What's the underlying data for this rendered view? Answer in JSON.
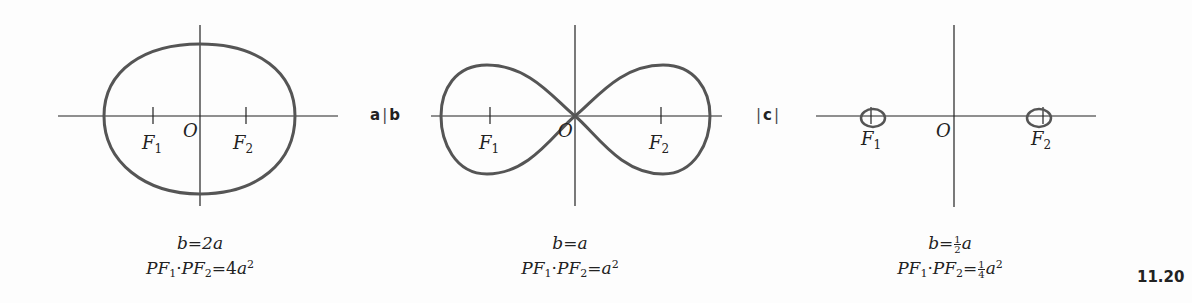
{
  "figure": {
    "number": "11.20",
    "stroke_color": "#555555",
    "axis_color": "#222222"
  },
  "panel_tags": {
    "a": "a",
    "b": "b",
    "c": "c"
  },
  "panels": [
    {
      "id": "a",
      "curve": "oval of Cassini (single oval)",
      "labels": {
        "origin": "O",
        "focus1": "F",
        "focus1_sub": "1",
        "focus2": "F",
        "focus2_sub": "2"
      },
      "caption": {
        "line1_lhs": "b",
        "line1_eq": "=",
        "line1_rhs": "2a",
        "line2_p1": "PF",
        "line2_s1": "1",
        "line2_dot": "·",
        "line2_p2": "PF",
        "line2_s2": "2",
        "line2_eq": "=",
        "line2_coef": "4",
        "line2_var": "a",
        "line2_exp": "2"
      }
    },
    {
      "id": "b",
      "curve": "lemniscate of Bernoulli",
      "labels": {
        "origin": "O",
        "focus1": "F",
        "focus1_sub": "1",
        "focus2": "F",
        "focus2_sub": "2"
      },
      "caption": {
        "line1_lhs": "b",
        "line1_eq": "=",
        "line1_rhs": "a",
        "line2_p1": "PF",
        "line2_s1": "1",
        "line2_dot": "·",
        "line2_p2": "PF",
        "line2_s2": "2",
        "line2_eq": "=",
        "line2_var": "a",
        "line2_exp": "2"
      }
    },
    {
      "id": "c",
      "curve": "two separate ovals",
      "labels": {
        "origin": "O",
        "focus1": "F",
        "focus1_sub": "1",
        "focus2": "F",
        "focus2_sub": "2"
      },
      "caption": {
        "line1_lhs": "b",
        "line1_eq": "=",
        "line1_frac_num": "1",
        "line1_frac_den": "2",
        "line1_var": "a",
        "line2_p1": "PF",
        "line2_s1": "1",
        "line2_dot": "·",
        "line2_p2": "PF",
        "line2_s2": "2",
        "line2_eq": "=",
        "line2_frac_num": "1",
        "line2_frac_den": "4",
        "line2_var": "a",
        "line2_exp": "2"
      }
    }
  ]
}
